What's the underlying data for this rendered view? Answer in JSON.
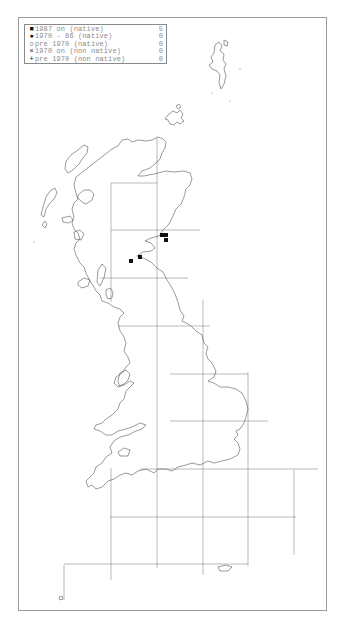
{
  "legend": {
    "items": [
      {
        "symbol": "■",
        "symbol_name": "filled-square",
        "label": "1987 on (native)",
        "count": "5"
      },
      {
        "symbol": "●",
        "symbol_name": "filled-circle",
        "label": "1970 - 86 (native)",
        "count": "0"
      },
      {
        "symbol": "○",
        "symbol_name": "open-circle",
        "label": "pre 1970 (native)",
        "count": "0"
      },
      {
        "symbol": "×",
        "symbol_name": "cross",
        "label": "1970 on (non native)",
        "count": "0"
      },
      {
        "symbol": "+",
        "symbol_name": "plus",
        "label": "pre 1970 (non native)",
        "count": "0"
      }
    ]
  },
  "map": {
    "region": "Great Britain",
    "grid": "100 km squares",
    "records": [
      {
        "x": 162,
        "y": 235,
        "category": "1987 on (native)"
      },
      {
        "x": 166,
        "y": 235,
        "category": "1987 on (native)"
      },
      {
        "x": 166,
        "y": 240,
        "category": "1987 on (native)"
      },
      {
        "x": 140,
        "y": 257,
        "category": "1987 on (native)"
      },
      {
        "x": 131,
        "y": 261,
        "category": "1987 on (native)"
      }
    ],
    "colors": {
      "record": "#111111",
      "coast": "#555555",
      "grid": "#8a8a8a"
    }
  }
}
